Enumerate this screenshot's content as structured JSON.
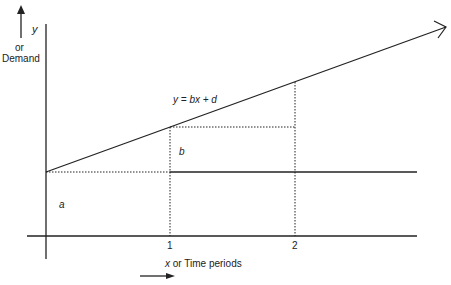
{
  "diagram": {
    "y_axis_label_var": "y",
    "y_axis_label_or": "or",
    "y_axis_label_name": "Demand",
    "x_axis_label_var": "x",
    "x_axis_label_rest": " or Time periods",
    "equation": "y = bx + d",
    "label_a": "a",
    "label_b": "b",
    "tick_1": "1",
    "tick_2": "2",
    "colors": {
      "line": "#222222",
      "background": "#ffffff"
    }
  }
}
